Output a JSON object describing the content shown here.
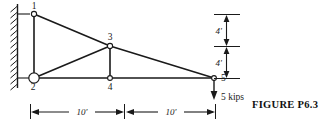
{
  "figure": {
    "caption": "FIGURE  P6.3",
    "type": "structural-truss-diagram",
    "colors": {
      "line": "#1a1a1a",
      "background": "#ffffff",
      "text": "#111111"
    }
  },
  "nodes": [
    {
      "id": "1",
      "label": "1",
      "x": 34,
      "y": 14,
      "marker": "small-circle"
    },
    {
      "id": "2",
      "label": "2",
      "x": 34,
      "y": 78,
      "marker": "large-circle"
    },
    {
      "id": "3",
      "label": "3",
      "x": 110,
      "y": 46,
      "marker": "small-circle"
    },
    {
      "id": "4",
      "label": "4",
      "x": 110,
      "y": 78,
      "marker": "small-circle"
    },
    {
      "id": "5",
      "label": "5",
      "x": 214,
      "y": 78,
      "marker": "small-circle"
    }
  ],
  "members": [
    {
      "from": "1",
      "to": "2"
    },
    {
      "from": "1",
      "to": "3"
    },
    {
      "from": "3",
      "to": "5"
    },
    {
      "from": "2",
      "to": "3"
    },
    {
      "from": "2",
      "to": "4"
    },
    {
      "from": "4",
      "to": "5"
    },
    {
      "from": "3",
      "to": "4"
    }
  ],
  "support": {
    "name": "fixed-wall",
    "wall_x": 17,
    "wall_top": 4,
    "wall_bottom": 88,
    "hatch_count": 13
  },
  "load": {
    "label": "5 kips",
    "magnitude": 5,
    "unit": "kips",
    "direction": "down",
    "at_node": "5"
  },
  "dimensions": {
    "horizontal": [
      {
        "label": "10'",
        "value": 10,
        "unit": "ft",
        "from_node": "2",
        "to_node": "4"
      },
      {
        "label": "10'",
        "value": 10,
        "unit": "ft",
        "from_node": "4",
        "to_node": "5"
      }
    ],
    "vertical": [
      {
        "label": "4'",
        "value": 4,
        "unit": "ft",
        "segment": "upper"
      },
      {
        "label": "4'",
        "value": 4,
        "unit": "ft",
        "segment": "lower"
      }
    ]
  }
}
